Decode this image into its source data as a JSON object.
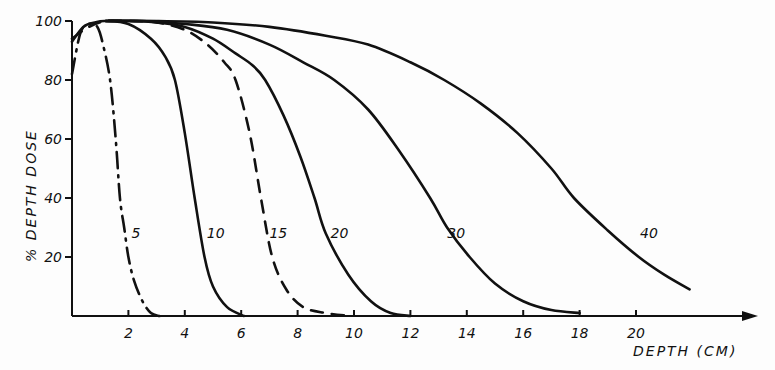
{
  "chart_data": {
    "type": "line",
    "title": "",
    "xlabel": "DEPTH (CM)",
    "ylabel": "% DEPTH DOSE",
    "xlim": [
      0,
      23.5
    ],
    "ylim": [
      0,
      100
    ],
    "x_ticks": [
      "2",
      "4",
      "6",
      "8",
      "10",
      "12",
      "14",
      "16",
      "18",
      "20"
    ],
    "y_ticks": [
      "20",
      "40",
      "60",
      "80",
      "100"
    ],
    "grid": false,
    "legend": "inline curve labels",
    "series": [
      {
        "name": "5",
        "style": "dash-dot",
        "x": [
          0.0,
          0.3,
          0.6,
          0.9,
          1.1,
          1.35,
          1.55,
          1.7,
          1.85,
          2.0,
          2.2,
          2.5,
          2.8,
          3.1
        ],
        "y": [
          82,
          96,
          99,
          98,
          92,
          80,
          60,
          40,
          30,
          20,
          12,
          5,
          1,
          0
        ]
      },
      {
        "name": "10",
        "style": "solid",
        "x": [
          0.0,
          0.4,
          0.8,
          1.2,
          2.0,
          2.8,
          3.3,
          3.65,
          4.0,
          4.35,
          4.7,
          5.0,
          5.5,
          6.1
        ],
        "y": [
          93,
          98,
          99.5,
          100,
          99,
          94,
          88,
          80,
          62,
          40,
          20,
          10,
          3,
          0
        ]
      },
      {
        "name": "15",
        "style": "dashed",
        "x": [
          0.0,
          0.6,
          1.2,
          2.0,
          3.0,
          4.0,
          4.8,
          5.4,
          5.8,
          6.3,
          6.7,
          7.1,
          7.6,
          8.2,
          9.0,
          9.9
        ],
        "y": [
          94,
          98,
          100,
          100,
          99.5,
          97,
          92,
          86,
          80,
          62,
          40,
          20,
          9,
          3,
          1,
          0
        ]
      },
      {
        "name": "20",
        "style": "solid",
        "x": [
          1.2,
          2.0,
          3.0,
          4.0,
          5.0,
          5.8,
          6.4,
          6.85,
          7.5,
          8.1,
          8.6,
          9.0,
          9.8,
          10.6,
          11.3,
          12.0
        ],
        "y": [
          100,
          100,
          99.5,
          98,
          94,
          89,
          85,
          80,
          68,
          54,
          40,
          28,
          14,
          5,
          1,
          0
        ]
      },
      {
        "name": "30",
        "style": "solid",
        "x": [
          1.2,
          2.5,
          4.0,
          5.5,
          7.0,
          8.2,
          9.3,
          10.5,
          11.6,
          12.7,
          13.3,
          14.1,
          15.0,
          16.0,
          17.0,
          18.0
        ],
        "y": [
          100,
          100,
          99,
          97,
          92,
          86,
          80,
          70,
          56,
          40,
          30,
          20,
          11,
          5,
          2,
          1
        ]
      },
      {
        "name": "40",
        "style": "solid",
        "x": [
          1.2,
          3.0,
          5.0,
          7.0,
          9.0,
          10.5,
          12.0,
          13.2,
          14.5,
          15.8,
          17.0,
          17.8,
          19.0,
          20.1,
          21.0,
          21.9
        ],
        "y": [
          100,
          100,
          99.5,
          98,
          95,
          92,
          86,
          80,
          72,
          62,
          50,
          40,
          29,
          20,
          14,
          9
        ]
      }
    ],
    "annotations": [
      {
        "text": "5",
        "x": 2.0,
        "y": 27
      },
      {
        "text": "10",
        "x": 4.6,
        "y": 27
      },
      {
        "text": "15",
        "x": 7.0,
        "y": 27
      },
      {
        "text": "20",
        "x": 9.1,
        "y": 27
      },
      {
        "text": "30",
        "x": 13.2,
        "y": 27
      },
      {
        "text": "40",
        "x": 20.0,
        "y": 27
      }
    ]
  },
  "axes": {
    "xlabel": "DEPTH (CM)",
    "ylabel": "% DEPTH DOSE"
  }
}
